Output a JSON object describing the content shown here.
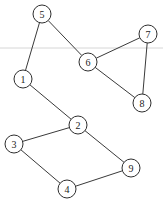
{
  "diagram": {
    "type": "undirected-graph",
    "node_radius": 9,
    "colors": {
      "stroke": "#2e2e2e",
      "edge": "#3a3a3a",
      "fill": "#ffffff",
      "text": "#222222"
    },
    "nodes": [
      {
        "id": "1",
        "label": "1",
        "x": 23,
        "y": 79
      },
      {
        "id": "2",
        "label": "2",
        "x": 78,
        "y": 125
      },
      {
        "id": "3",
        "label": "3",
        "x": 14,
        "y": 144
      },
      {
        "id": "4",
        "label": "4",
        "x": 67,
        "y": 189
      },
      {
        "id": "5",
        "label": "5",
        "x": 42,
        "y": 14
      },
      {
        "id": "6",
        "label": "6",
        "x": 88,
        "y": 62
      },
      {
        "id": "7",
        "label": "7",
        "x": 148,
        "y": 34
      },
      {
        "id": "8",
        "label": "8",
        "x": 142,
        "y": 103
      },
      {
        "id": "9",
        "label": "9",
        "x": 131,
        "y": 168
      }
    ],
    "edges": [
      [
        "5",
        "1"
      ],
      [
        "5",
        "6"
      ],
      [
        "6",
        "7"
      ],
      [
        "6",
        "8"
      ],
      [
        "7",
        "8"
      ],
      [
        "1",
        "2"
      ],
      [
        "2",
        "3"
      ],
      [
        "2",
        "9"
      ],
      [
        "3",
        "4"
      ],
      [
        "4",
        "9"
      ]
    ]
  }
}
